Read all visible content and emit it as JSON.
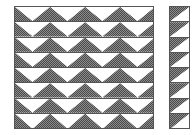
{
  "figure": {
    "name": "triangular-wave-pattern-diagram",
    "background_color": "#ffffff",
    "border_color": "#555555",
    "fill_color": "#8c8c8c",
    "fill_dark_color": "#4a4a4a",
    "fill_style": "dithered-checkerboard-gray",
    "width": 196,
    "height": 135
  },
  "panels": [
    {
      "id": "wide-panel",
      "label": "",
      "x": 14,
      "y": 6,
      "width": 140,
      "height": 123,
      "rows": 8,
      "row_height": 15.25,
      "peaks_per_row": 4,
      "half_peak_left": true,
      "half_peak_right": true,
      "shape": "upward-triangle",
      "row_labels": [
        "",
        "",
        "",
        "",
        "",
        "",
        "",
        ""
      ]
    },
    {
      "id": "narrow-panel",
      "label": "",
      "x": 169,
      "y": 6,
      "width": 21,
      "height": 123,
      "rows": 8,
      "row_height": 15.25,
      "peaks_per_row": 1,
      "shape": "upper-left-triangle",
      "row_labels": [
        "",
        "",
        "",
        "",
        "",
        "",
        "",
        ""
      ]
    }
  ]
}
